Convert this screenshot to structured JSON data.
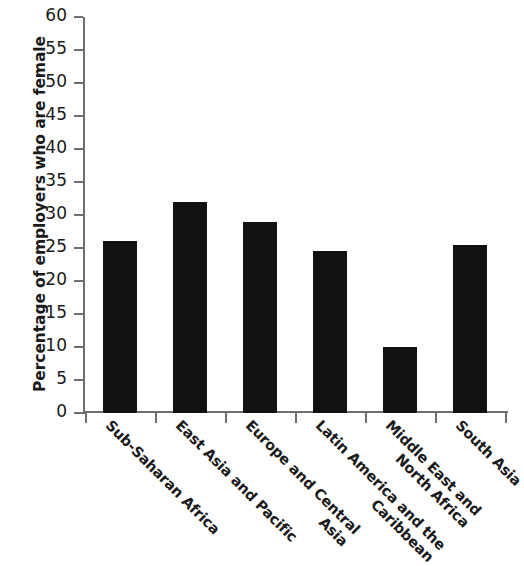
{
  "chart_data": {
    "type": "bar",
    "title": "",
    "subtitle": "",
    "xlabel": "",
    "ylabel": "Percentage of employers who are female",
    "categories": [
      "Sub-Saharan Africa",
      "East Asia and Pacific",
      "Europe and Central Asia",
      "Latin America and the Caribbean",
      "Middle East and North Africa",
      "South Asia"
    ],
    "category_lines": [
      [
        "Sub-Saharan Africa"
      ],
      [
        "East Asia and Pacific"
      ],
      [
        "Europe and Central",
        "Asia"
      ],
      [
        "Latin America and the",
        "Caribbean"
      ],
      [
        "Middle East and",
        "North Africa"
      ],
      [
        "South Asia"
      ]
    ],
    "values": [
      26,
      32,
      29,
      24.5,
      10,
      25.5
    ],
    "ylim": [
      0,
      60
    ],
    "ytick_labels": [
      "60",
      "55",
      "50",
      "45",
      "40",
      "35",
      "30",
      "25",
      "20",
      "15",
      "10",
      "5",
      "0"
    ],
    "ytick_values": [
      60,
      55,
      50,
      45,
      40,
      35,
      30,
      25,
      20,
      15,
      10,
      5,
      0
    ],
    "ytick_step": 5,
    "grid": false,
    "legend": null,
    "legend_position": "none",
    "bar_color": "#111111",
    "axis_color": "#6f6f6f",
    "background_color": "#ffffff",
    "annotations": []
  }
}
